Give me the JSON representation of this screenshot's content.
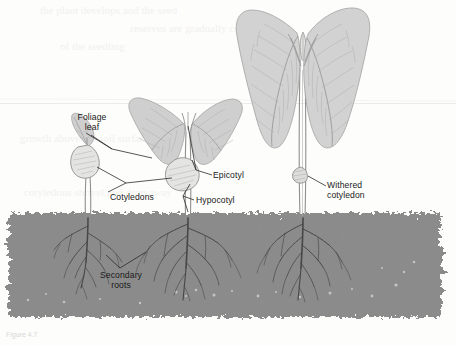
{
  "figure": {
    "caption": "Figure 4.7",
    "background_color": "#fdfdfc",
    "soil_color": "#8a8a8a",
    "leaf_color": "#d2d2d2",
    "leaf_vein_color": "#a9a9a9",
    "root_color": "#4a4a4a",
    "outline_color": "#9a9a9a",
    "label_color": "#1a1a1a",
    "leader_color": "#2b2b2b"
  },
  "labels": [
    {
      "id": "foliage-leaf",
      "text": "Foliage\nleaf",
      "x": 92,
      "y": 115,
      "align": "center"
    },
    {
      "id": "epicotyl",
      "text": "Epicotyl",
      "x": 214,
      "y": 172,
      "align": "left"
    },
    {
      "id": "cotyledons",
      "text": "Cotyledons",
      "x": 112,
      "y": 195,
      "align": "left"
    },
    {
      "id": "hypocotyl",
      "text": "Hypocotyl",
      "x": 196,
      "y": 198,
      "align": "left"
    },
    {
      "id": "withered-cotyledon",
      "text": "Withered\ncotyledon",
      "x": 328,
      "y": 184,
      "align": "left"
    },
    {
      "id": "secondary-roots",
      "text": "Secondary\nroots",
      "x": 120,
      "y": 274,
      "align": "center"
    }
  ],
  "soil": {
    "top": 213,
    "bottom": 318,
    "left": 8,
    "right": 442
  },
  "plants": [
    {
      "id": "seedling-young",
      "stage": "young seedling",
      "stem_x": 88,
      "leaves": 1,
      "has_cotyledons": true,
      "root_depth": 285
    },
    {
      "id": "seedling-middle",
      "stage": "middle seedling",
      "stem_x": 188,
      "leaves": 2,
      "has_cotyledons": true,
      "root_depth": 300
    },
    {
      "id": "plant-mature",
      "stage": "mature plant",
      "stem_x": 304,
      "leaves": 2,
      "has_cotyledons": false,
      "root_depth": 300
    }
  ],
  "ghost_text": {
    "note": "faint bleed-through text from reverse of scanned page",
    "lines": [
      "the plant develops and the seed",
      "reserves are gradually consumed",
      "of the seedling",
      "growth above the soil surface",
      "cotyledons shrivel and drop away"
    ]
  }
}
